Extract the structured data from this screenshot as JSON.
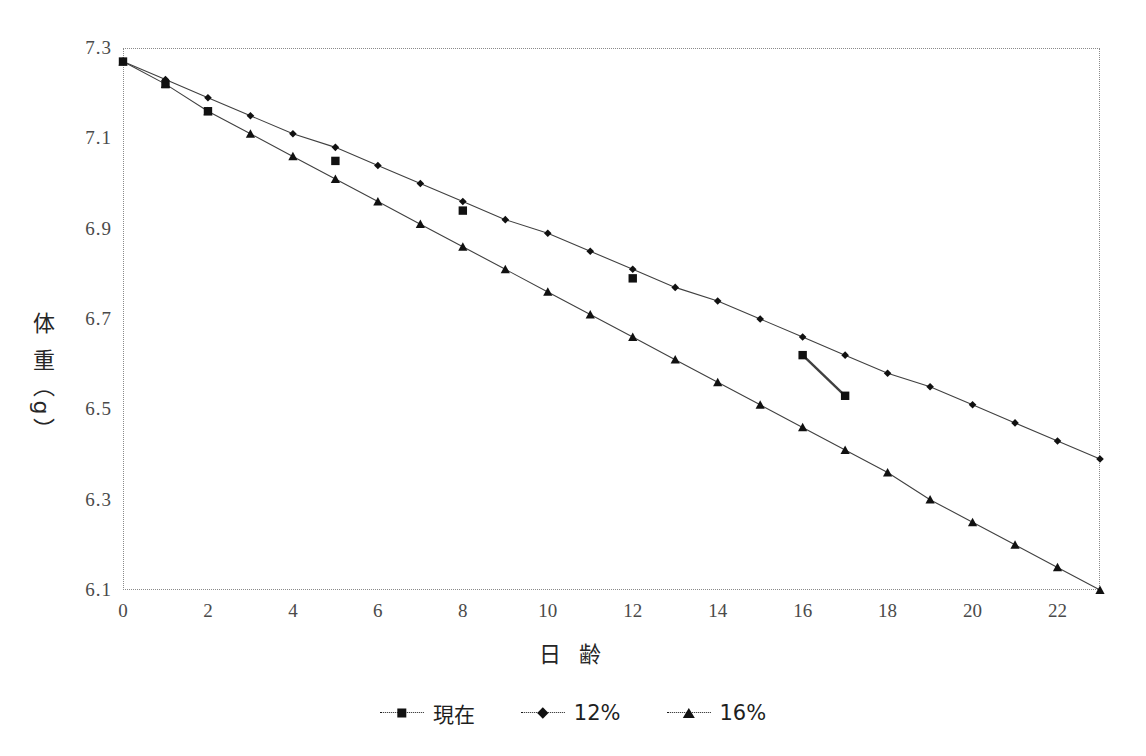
{
  "chart_data": {
    "type": "line",
    "title": "",
    "xlabel": "日 齢",
    "ylabel": "体 重（g）",
    "xlim": [
      0,
      23
    ],
    "ylim": [
      6.1,
      7.3
    ],
    "xticks": [
      0,
      2,
      4,
      6,
      8,
      10,
      12,
      14,
      16,
      18,
      20,
      22
    ],
    "yticks": [
      6.1,
      6.3,
      6.5,
      6.7,
      6.9,
      7.1,
      7.3
    ],
    "grid": false,
    "legend_position": "bottom",
    "series": [
      {
        "name": "現在",
        "marker": "square",
        "line": "segments",
        "x": [
          0,
          1,
          2,
          5,
          8,
          12,
          16,
          17
        ],
        "values": [
          7.27,
          7.22,
          7.16,
          7.05,
          6.94,
          6.79,
          6.62,
          6.53
        ]
      },
      {
        "name": "12%",
        "marker": "diamond",
        "line": "solid",
        "x": [
          0,
          1,
          2,
          3,
          4,
          5,
          6,
          7,
          8,
          9,
          10,
          11,
          12,
          13,
          14,
          15,
          16,
          17,
          18,
          19,
          20,
          21,
          22,
          23
        ],
        "values": [
          7.27,
          7.23,
          7.19,
          7.15,
          7.11,
          7.08,
          7.04,
          7.0,
          6.96,
          6.92,
          6.89,
          6.85,
          6.81,
          6.77,
          6.74,
          6.7,
          6.66,
          6.62,
          6.58,
          6.55,
          6.51,
          6.47,
          6.43,
          6.39
        ]
      },
      {
        "name": "16%",
        "marker": "triangle",
        "line": "solid",
        "x": [
          0,
          1,
          2,
          3,
          4,
          5,
          6,
          7,
          8,
          9,
          10,
          11,
          12,
          13,
          14,
          15,
          16,
          17,
          18,
          19,
          20,
          21,
          22,
          23
        ],
        "values": [
          7.27,
          7.22,
          7.16,
          7.11,
          7.06,
          7.01,
          6.96,
          6.91,
          6.86,
          6.81,
          6.76,
          6.71,
          6.66,
          6.61,
          6.56,
          6.51,
          6.46,
          6.41,
          6.36,
          6.3,
          6.25,
          6.2,
          6.15,
          6.1
        ]
      }
    ]
  },
  "axis": {
    "y_tick_labels": [
      "7.3",
      "7.1",
      "6.9",
      "6.7",
      "6.5",
      "6.3",
      "6.1"
    ],
    "x_tick_labels": [
      "0",
      "2",
      "4",
      "6",
      "8",
      "10",
      "12",
      "14",
      "16",
      "18",
      "20",
      "22"
    ],
    "y_title": "体 重（g）",
    "x_title": "日 齢"
  },
  "legend": {
    "items": [
      {
        "label": "現在",
        "marker": "square-marker"
      },
      {
        "label": "12%",
        "marker": "diamond-marker"
      },
      {
        "label": "16%",
        "marker": "triangle-marker"
      }
    ]
  },
  "colors": {
    "line": "#404040",
    "marker": "#111111",
    "frame": "#8a8a8a",
    "text": "#3a3a3a",
    "background": "#ffffff"
  }
}
